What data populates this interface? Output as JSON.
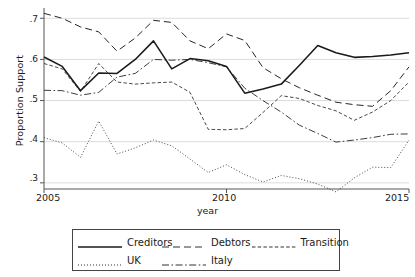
{
  "chart_data": {
    "type": "line",
    "title": "",
    "xlabel": "year",
    "ylabel": "Proportion Support",
    "xlim": [
      2005,
      2015
    ],
    "ylim": [
      0.285,
      0.725
    ],
    "grid": true,
    "gridlines_y": [
      0.3,
      0.4,
      0.5,
      0.6,
      0.7
    ],
    "ytick_labels": [
      ".3",
      ".4",
      ".5",
      ".6",
      ".7"
    ],
    "ytick_values": [
      0.3,
      0.4,
      0.5,
      0.6,
      0.7
    ],
    "xtick_labels": [
      "2005",
      "2010",
      "2015"
    ],
    "xtick_values": [
      2005,
      2010,
      2015
    ],
    "legend_position": "below-plot",
    "x": [
      2005,
      2005.5,
      2006,
      2006.5,
      2007,
      2007.5,
      2008,
      2008.5,
      2009,
      2009.5,
      2010,
      2010.5,
      2011,
      2011.5,
      2012,
      2012.5,
      2013,
      2013.5,
      2014,
      2014.5,
      2015
    ],
    "series": [
      {
        "name": "Creditors",
        "style": "solid",
        "values": [
          0.606,
          0.583,
          0.524,
          0.567,
          0.566,
          0.6,
          0.645,
          0.577,
          0.602,
          0.597,
          0.583,
          0.518,
          0.528,
          0.54,
          0.586,
          0.634,
          0.616,
          0.605,
          0.607,
          0.611,
          0.616
        ]
      },
      {
        "name": "Debtors",
        "style": "dashed",
        "values": [
          0.712,
          0.7,
          0.679,
          0.667,
          0.62,
          0.652,
          0.695,
          0.69,
          0.645,
          0.626,
          0.662,
          0.646,
          0.58,
          0.553,
          0.531,
          0.513,
          0.496,
          0.49,
          0.486,
          0.524,
          0.582
        ]
      },
      {
        "name": "Transition",
        "style": "fine-dash",
        "values": [
          0.59,
          0.577,
          0.522,
          0.59,
          0.545,
          0.54,
          0.543,
          0.545,
          0.52,
          0.43,
          0.429,
          0.432,
          0.471,
          0.512,
          0.505,
          0.488,
          0.475,
          0.452,
          0.472,
          0.5,
          0.545
        ]
      },
      {
        "name": "UK",
        "style": "dotted",
        "values": [
          0.41,
          0.397,
          0.362,
          0.45,
          0.37,
          0.385,
          0.404,
          0.39,
          0.358,
          0.325,
          0.344,
          0.32,
          0.302,
          0.318,
          0.31,
          0.297,
          0.278,
          0.312,
          0.338,
          0.337,
          0.404
        ]
      },
      {
        "name": "Italy",
        "style": "dash-dot",
        "values": [
          0.525,
          0.524,
          0.513,
          0.52,
          0.557,
          0.566,
          0.6,
          0.598,
          0.6,
          0.592,
          0.582,
          0.53,
          0.5,
          0.472,
          0.44,
          0.42,
          0.399,
          0.404,
          0.41,
          0.418,
          0.419
        ]
      }
    ]
  },
  "legend": {
    "rows": [
      [
        {
          "label": "Creditors",
          "style": "solid"
        },
        {
          "label": "Debtors",
          "style": "dashed"
        },
        {
          "label": "Transition",
          "style": "fine-dash"
        }
      ],
      [
        {
          "label": "UK",
          "style": "dotted"
        },
        {
          "label": "Italy",
          "style": "dash-dot"
        }
      ]
    ]
  },
  "colors": {
    "line": "#1a1a1a",
    "grid": "#d8d8d8",
    "axis": "#555555",
    "background": "#ffffff"
  }
}
